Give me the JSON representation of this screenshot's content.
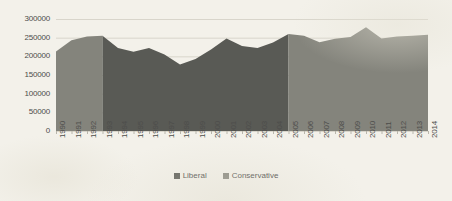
{
  "chart_data": {
    "type": "area",
    "title": "",
    "subtitle": "",
    "xlabel": "",
    "ylabel": "",
    "stacked": false,
    "grid": true,
    "gridlines_horizontal_only": true,
    "legend_position": "bottom-center",
    "ylim": [
      0,
      300000
    ],
    "ytick_step": 50000,
    "ytick_labels": [
      "300000",
      "250000",
      "200000",
      "150000",
      "100000",
      "50000",
      "0"
    ],
    "ytick_values": [
      300000,
      250000,
      200000,
      150000,
      100000,
      50000,
      0
    ],
    "categories": [
      "1990",
      "1991",
      "1992",
      "1993",
      "1994",
      "1995",
      "1996",
      "1997",
      "1998",
      "1999",
      "2000",
      "2001",
      "2002",
      "2003",
      "2004",
      "2005",
      "2006",
      "2007",
      "2008",
      "2009",
      "2010",
      "2011",
      "2012",
      "2013",
      "2014"
    ],
    "xtick_rotation": -90,
    "series": [
      {
        "name": "Liberal",
        "color": "#595a55",
        "note": "governing party years 1994-2005 shaded darker",
        "year_range": [
          "1994",
          "2005"
        ],
        "values": [
          null,
          null,
          null,
          null,
          222000,
          212000,
          222000,
          205000,
          178000,
          193000,
          218000,
          248000,
          228000,
          222000,
          237000,
          260000,
          null,
          null,
          null,
          null,
          null,
          null,
          null,
          null,
          null
        ]
      },
      {
        "name": "Conservative",
        "color": "#84847c",
        "note": "governing party years 1990-1993 and 2006-2014 shaded lighter",
        "year_range": [
          "1990",
          "1993",
          "2006",
          "2014"
        ],
        "values": [
          213000,
          243000,
          253000,
          255000,
          null,
          null,
          null,
          null,
          null,
          null,
          null,
          null,
          null,
          null,
          null,
          null,
          255000,
          238000,
          247000,
          252000,
          278000,
          248000,
          253000,
          255000,
          258000
        ]
      }
    ],
    "combined_values": [
      213000,
      243000,
      253000,
      255000,
      222000,
      212000,
      222000,
      205000,
      178000,
      193000,
      218000,
      248000,
      228000,
      222000,
      237000,
      260000,
      255000,
      238000,
      247000,
      252000,
      278000,
      248000,
      253000,
      255000,
      258000
    ]
  },
  "legend": {
    "items": [
      {
        "label": "Liberal",
        "color": "#595a55"
      },
      {
        "label": "Conservative",
        "color": "#84847c"
      }
    ]
  },
  "colors": {
    "background": "#f3f1ea",
    "gridline": "#d8d5cb",
    "axis_text": "#4d4d4b",
    "liberal": "#595a55",
    "conservative": "#84847c"
  }
}
